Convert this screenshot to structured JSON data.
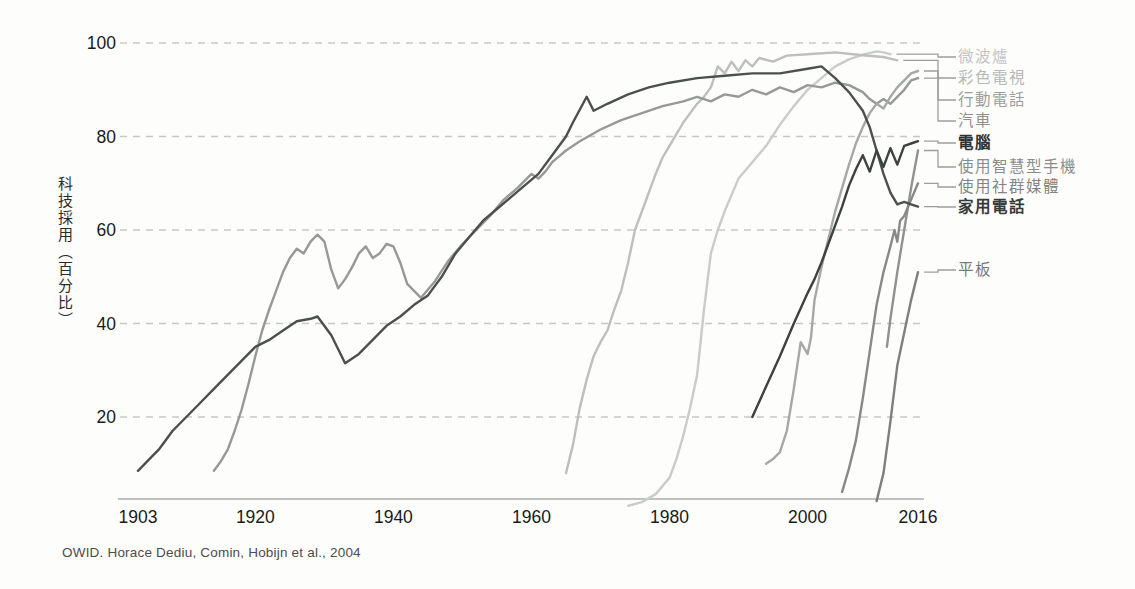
{
  "chart_data": {
    "type": "line",
    "title": "",
    "ylabel": "科技採用（百分比）",
    "source": "OWID. Horace Dediu, Comin, Hobijn et al., 2004",
    "x_ticks": [
      "1903",
      "1920",
      "1940",
      "1960",
      "1980",
      "2000",
      "2016"
    ],
    "x_tick_years": [
      1903,
      1920,
      1940,
      1960,
      1980,
      2000,
      2016
    ],
    "y_ticks": [
      "100",
      "80",
      "60",
      "40",
      "20"
    ],
    "y_tick_values": [
      100,
      80,
      60,
      40,
      20
    ],
    "xlim": [
      1903,
      2016
    ],
    "ylim": [
      0,
      100
    ],
    "grid": "horizontal-dashed",
    "legend_position": "right",
    "series": [
      {
        "id": "microwave",
        "name": "微波爐",
        "color": "#c9cccb",
        "text_color": "#c2c5c4",
        "bold": false,
        "data": [
          [
            1974,
            1
          ],
          [
            1976,
            1.8
          ],
          [
            1978,
            3.5
          ],
          [
            1980,
            7
          ],
          [
            1981,
            11
          ],
          [
            1982,
            16
          ],
          [
            1983,
            22
          ],
          [
            1984,
            29
          ],
          [
            1985,
            43
          ],
          [
            1986,
            55
          ],
          [
            1987,
            60
          ],
          [
            1988,
            64
          ],
          [
            1989,
            67.5
          ],
          [
            1990,
            71
          ],
          [
            1992,
            74.5
          ],
          [
            1994,
            78
          ],
          [
            1996,
            82.5
          ],
          [
            1998,
            86.5
          ],
          [
            2000,
            90
          ],
          [
            2002,
            92.5
          ],
          [
            2004,
            95
          ],
          [
            2006,
            96.5
          ],
          [
            2008,
            97.5
          ],
          [
            2010,
            98.2
          ],
          [
            2011,
            98
          ],
          [
            2012,
            97.6
          ]
        ]
      },
      {
        "id": "color-tv",
        "name": "彩色電視",
        "color": "#bcbfbe",
        "text_color": "#b5b8b7",
        "bold": false,
        "data": [
          [
            1965,
            8
          ],
          [
            1966,
            14
          ],
          [
            1967,
            22
          ],
          [
            1968,
            28
          ],
          [
            1969,
            33
          ],
          [
            1970,
            36
          ],
          [
            1971,
            38.5
          ],
          [
            1972,
            43
          ],
          [
            1973,
            47
          ],
          [
            1974,
            53
          ],
          [
            1975,
            60
          ],
          [
            1976,
            64
          ],
          [
            1977,
            68
          ],
          [
            1978,
            72
          ],
          [
            1979,
            75.5
          ],
          [
            1980,
            78
          ],
          [
            1981,
            80.5
          ],
          [
            1982,
            83
          ],
          [
            1983,
            85
          ],
          [
            1984,
            87
          ],
          [
            1985,
            88.5
          ],
          [
            1986,
            90.5
          ],
          [
            1987,
            95
          ],
          [
            1988,
            93.5
          ],
          [
            1989,
            96
          ],
          [
            1990,
            94
          ],
          [
            1991,
            96.3
          ],
          [
            1992,
            95
          ],
          [
            1993,
            96.8
          ],
          [
            1995,
            96
          ],
          [
            1997,
            97.3
          ],
          [
            2000,
            97.6
          ],
          [
            2004,
            98
          ],
          [
            2008,
            97.4
          ],
          [
            2011,
            97
          ],
          [
            2013,
            96.3
          ]
        ]
      },
      {
        "id": "mobile-phone",
        "name": "行動電話",
        "color": "#a5a8a7",
        "text_color": "#9b9e9d",
        "bold": false,
        "data": [
          [
            1994,
            10
          ],
          [
            1995,
            11
          ],
          [
            1996,
            12.5
          ],
          [
            1997,
            17
          ],
          [
            1998,
            26
          ],
          [
            1999,
            36
          ],
          [
            2000,
            33.5
          ],
          [
            2000.5,
            37
          ],
          [
            2001,
            45
          ],
          [
            2002,
            52
          ],
          [
            2003,
            58
          ],
          [
            2004,
            64
          ],
          [
            2005,
            69
          ],
          [
            2006,
            74
          ],
          [
            2007,
            78.5
          ],
          [
            2008,
            82
          ],
          [
            2009,
            85
          ],
          [
            2010,
            87
          ],
          [
            2011,
            86
          ],
          [
            2012,
            88.5
          ],
          [
            2013,
            90.5
          ],
          [
            2014,
            92
          ],
          [
            2015,
            93.5
          ],
          [
            2016,
            94
          ]
        ]
      },
      {
        "id": "car",
        "name": "汽車",
        "color": "#969998",
        "text_color": "#8d908f",
        "bold": false,
        "data": [
          [
            1914,
            8.5
          ],
          [
            1915,
            10.5
          ],
          [
            1916,
            13
          ],
          [
            1917,
            17
          ],
          [
            1918,
            21.5
          ],
          [
            1919,
            27
          ],
          [
            1920,
            33
          ],
          [
            1921,
            38.5
          ],
          [
            1922,
            43
          ],
          [
            1923,
            47
          ],
          [
            1924,
            51
          ],
          [
            1925,
            54
          ],
          [
            1926,
            56
          ],
          [
            1927,
            55
          ],
          [
            1928,
            57.5
          ],
          [
            1929,
            59
          ],
          [
            1930,
            57.5
          ],
          [
            1931,
            51.5
          ],
          [
            1932,
            47.5
          ],
          [
            1933,
            49.5
          ],
          [
            1934,
            52
          ],
          [
            1935,
            55
          ],
          [
            1936,
            56.5
          ],
          [
            1937,
            54
          ],
          [
            1938,
            55
          ],
          [
            1939,
            57
          ],
          [
            1940,
            56.5
          ],
          [
            1941,
            53
          ],
          [
            1942,
            48.5
          ],
          [
            1943,
            47
          ],
          [
            1944,
            45.5
          ],
          [
            1946,
            49
          ],
          [
            1948,
            53.5
          ],
          [
            1950,
            57
          ],
          [
            1952,
            60
          ],
          [
            1954,
            63
          ],
          [
            1956,
            66.5
          ],
          [
            1958,
            69
          ],
          [
            1959,
            70.5
          ],
          [
            1960,
            72
          ],
          [
            1961,
            71
          ],
          [
            1962,
            72.5
          ],
          [
            1963,
            74.5
          ],
          [
            1965,
            77
          ],
          [
            1967,
            79
          ],
          [
            1970,
            81.5
          ],
          [
            1973,
            83.5
          ],
          [
            1976,
            85
          ],
          [
            1979,
            86.5
          ],
          [
            1982,
            87.5
          ],
          [
            1984,
            88.5
          ],
          [
            1986,
            87.5
          ],
          [
            1988,
            89
          ],
          [
            1990,
            88.5
          ],
          [
            1992,
            90
          ],
          [
            1994,
            89
          ],
          [
            1996,
            90.5
          ],
          [
            1998,
            89.5
          ],
          [
            2000,
            91
          ],
          [
            2002,
            90.5
          ],
          [
            2004,
            91.5
          ],
          [
            2006,
            91
          ],
          [
            2008,
            89.5
          ],
          [
            2009,
            88
          ],
          [
            2010,
            87
          ],
          [
            2011,
            88
          ],
          [
            2012,
            87
          ],
          [
            2013,
            88.5
          ],
          [
            2014,
            90
          ],
          [
            2015,
            92
          ],
          [
            2016,
            92.5
          ]
        ]
      },
      {
        "id": "computer",
        "name": "電腦",
        "color": "#3d4241",
        "text_color": "#2e3332",
        "bold": true,
        "data": [
          [
            1992,
            20
          ],
          [
            1994,
            26.5
          ],
          [
            1996,
            33
          ],
          [
            1998,
            40
          ],
          [
            2000,
            46.5
          ],
          [
            2001,
            49.5
          ],
          [
            2002,
            53
          ],
          [
            2003,
            57
          ],
          [
            2004,
            61
          ],
          [
            2005,
            65
          ],
          [
            2006,
            69.5
          ],
          [
            2007,
            73
          ],
          [
            2008,
            76
          ],
          [
            2009,
            72.5
          ],
          [
            2010,
            77
          ],
          [
            2011,
            73.5
          ],
          [
            2012,
            77.5
          ],
          [
            2013,
            74
          ],
          [
            2014,
            78
          ],
          [
            2015,
            78.5
          ],
          [
            2016,
            79
          ]
        ]
      },
      {
        "id": "smartphone",
        "name": "使用智慧型手機",
        "color": "#8f9291",
        "text_color": "#898c8b",
        "bold": false,
        "data": [
          [
            2011.5,
            35
          ],
          [
            2012,
            41
          ],
          [
            2013,
            51
          ],
          [
            2014,
            60
          ],
          [
            2015,
            69
          ],
          [
            2016,
            77
          ]
        ]
      },
      {
        "id": "social-media",
        "name": "使用社群媒體",
        "color": "#878a89",
        "text_color": "#828584",
        "bold": false,
        "data": [
          [
            2005,
            4
          ],
          [
            2006,
            9
          ],
          [
            2007,
            15
          ],
          [
            2008,
            24
          ],
          [
            2009,
            34
          ],
          [
            2010,
            44
          ],
          [
            2011,
            51
          ],
          [
            2012,
            56.5
          ],
          [
            2012.6,
            60
          ],
          [
            2013,
            57.5
          ],
          [
            2013.4,
            62
          ],
          [
            2014,
            63
          ],
          [
            2015,
            66.5
          ],
          [
            2016,
            70
          ]
        ]
      },
      {
        "id": "landline",
        "name": "家用電話",
        "color": "#4b504f",
        "text_color": "#353a39",
        "bold": true,
        "data": [
          [
            1903,
            8.5
          ],
          [
            1905,
            11.5
          ],
          [
            1906,
            13
          ],
          [
            1908,
            17
          ],
          [
            1910,
            20
          ],
          [
            1912,
            23
          ],
          [
            1914,
            26
          ],
          [
            1916,
            29
          ],
          [
            1918,
            32
          ],
          [
            1920,
            35
          ],
          [
            1922,
            36.5
          ],
          [
            1924,
            38.5
          ],
          [
            1926,
            40.5
          ],
          [
            1928,
            41
          ],
          [
            1929,
            41.5
          ],
          [
            1931,
            37.5
          ],
          [
            1933,
            31.5
          ],
          [
            1935,
            33.5
          ],
          [
            1937,
            36.5
          ],
          [
            1939,
            39.5
          ],
          [
            1941,
            41.5
          ],
          [
            1943,
            44
          ],
          [
            1945,
            46
          ],
          [
            1947,
            50
          ],
          [
            1949,
            55
          ],
          [
            1951,
            58.5
          ],
          [
            1953,
            62
          ],
          [
            1955,
            64.5
          ],
          [
            1957,
            67
          ],
          [
            1959,
            69.5
          ],
          [
            1961,
            72
          ],
          [
            1963,
            76
          ],
          [
            1965,
            80
          ],
          [
            1966,
            83
          ],
          [
            1968,
            88.5
          ],
          [
            1969,
            85.5
          ],
          [
            1971,
            87
          ],
          [
            1974,
            89
          ],
          [
            1977,
            90.5
          ],
          [
            1980,
            91.5
          ],
          [
            1984,
            92.5
          ],
          [
            1988,
            93
          ],
          [
            1992,
            93.5
          ],
          [
            1996,
            93.5
          ],
          [
            2000,
            94.5
          ],
          [
            2002,
            95
          ],
          [
            2004,
            92.5
          ],
          [
            2006,
            89.5
          ],
          [
            2008,
            85.5
          ],
          [
            2009,
            82
          ],
          [
            2010,
            77
          ],
          [
            2011,
            72
          ],
          [
            2012,
            68
          ],
          [
            2013,
            65.5
          ],
          [
            2014,
            66
          ],
          [
            2015,
            65.5
          ],
          [
            2016,
            65
          ]
        ]
      },
      {
        "id": "tablet",
        "name": "平板",
        "color": "#7d807f",
        "text_color": "#787b7a",
        "bold": false,
        "data": [
          [
            2010,
            2
          ],
          [
            2011,
            8
          ],
          [
            2012,
            19
          ],
          [
            2013,
            31
          ],
          [
            2014,
            38
          ],
          [
            2015,
            45
          ],
          [
            2016,
            51
          ]
        ]
      }
    ]
  }
}
